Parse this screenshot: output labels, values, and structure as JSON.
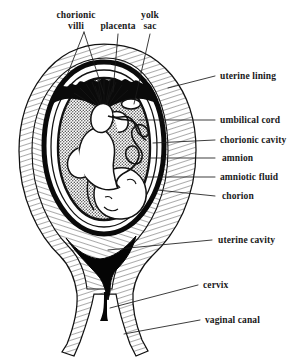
{
  "figure": {
    "background_color": "#ffffff",
    "ink_color": "#000000",
    "fill_amniotic": "#b0b0b0",
    "fill_fetus": "#ffffff",
    "fill_hatch": "#ffffff"
  },
  "labels": {
    "top": [
      {
        "id": "chorionic-villi",
        "text_line1": "chorionic",
        "text_line2": "villi"
      },
      {
        "id": "placenta",
        "text_line1": "placenta",
        "text_line2": ""
      },
      {
        "id": "yolk-sac",
        "text_line1": "yolk",
        "text_line2": "sac"
      }
    ],
    "right": [
      {
        "id": "uterine-lining",
        "text": "uterine lining"
      },
      {
        "id": "umbilical-cord",
        "text": "umbilical cord"
      },
      {
        "id": "chorionic-cavity",
        "text": "chorionic cavity"
      },
      {
        "id": "amnion",
        "text": "amnion"
      },
      {
        "id": "amniotic-fluid",
        "text": "amniotic fluid"
      },
      {
        "id": "chorion",
        "text": "chorion"
      },
      {
        "id": "uterine-cavity",
        "text": "uterine cavity"
      },
      {
        "id": "cervix",
        "text": "cervix"
      },
      {
        "id": "vaginal-canal",
        "text": "vaginal canal"
      }
    ]
  }
}
